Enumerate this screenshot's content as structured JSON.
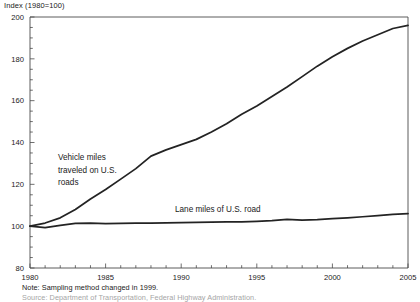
{
  "chart_data": {
    "type": "line",
    "title": "Index (1980=100)",
    "xlabel": "",
    "ylabel": "Index (1980=100)",
    "xlim": [
      1980,
      2005
    ],
    "ylim": [
      80,
      200
    ],
    "grid": false,
    "legend_position": "inline-annotations",
    "x": [
      1980,
      1981,
      1982,
      1983,
      1984,
      1985,
      1986,
      1987,
      1988,
      1989,
      1990,
      1991,
      1992,
      1993,
      1994,
      1995,
      1996,
      1997,
      1998,
      1999,
      2000,
      2001,
      2002,
      2003,
      2004,
      2005
    ],
    "y_ticks": [
      80,
      100,
      120,
      140,
      160,
      180,
      200
    ],
    "y_tick_labels": [
      "80",
      "100",
      "120",
      "140",
      "160",
      "180",
      "200"
    ],
    "y_minor_tick_step": 5,
    "x_ticks": [
      1980,
      1985,
      1990,
      1995,
      2000,
      2005
    ],
    "x_tick_labels": [
      "1980",
      "1985",
      "1990",
      "1995",
      "2000",
      "2005"
    ],
    "x_minor_tick_step": 1,
    "series": [
      {
        "name": "Vehicle miles traveled on U.S. roads",
        "annotation_lines": [
          "Vehicle miles",
          "traveled on U.S.",
          "roads"
        ],
        "color": "#232323",
        "values": [
          100,
          101.5,
          104,
          108,
          113,
          117.5,
          122.5,
          127.5,
          133.5,
          136.5,
          139,
          141.5,
          145,
          149,
          153.5,
          157.5,
          162,
          166.5,
          171.5,
          176.5,
          181,
          185,
          188.5,
          191.5,
          194.5,
          196
        ]
      },
      {
        "name": "Lane miles of U.S. road",
        "annotation_lines": [
          "Lane miles of U.S. road"
        ],
        "color": "#232323",
        "values": [
          100,
          99.3,
          100.4,
          101.3,
          101.5,
          101.2,
          101.3,
          101.4,
          101.5,
          101.6,
          101.7,
          101.8,
          101.9,
          102,
          102.1,
          102.3,
          102.6,
          103.3,
          102.9,
          103.1,
          103.6,
          104,
          104.5,
          105,
          105.6,
          106
        ]
      }
    ],
    "notes": {
      "primary": "Note: Sampling method changed in 1999.",
      "secondary": "Source: Department of Transportation, Federal Highway Administration."
    }
  }
}
